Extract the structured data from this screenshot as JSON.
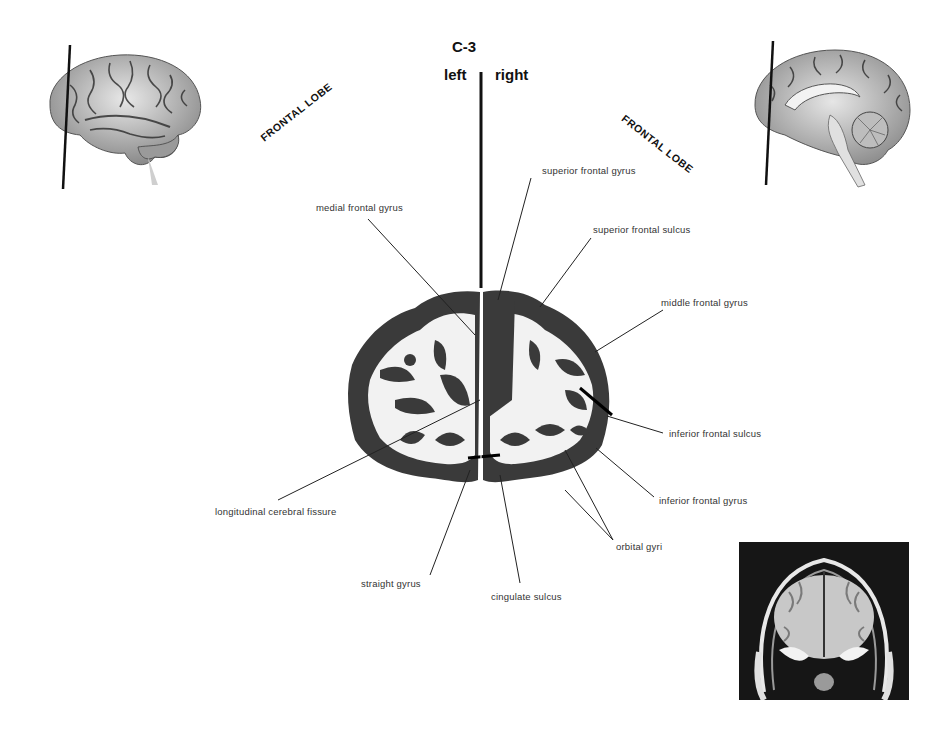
{
  "header": {
    "section": "C-3",
    "left_label": "left",
    "right_label": "right"
  },
  "lobes": {
    "left": "FRONTAL LOBE",
    "right": "FRONTAL LOBE"
  },
  "thumbnails": {
    "lateral_view": "lateral-brain-view",
    "medial_view": "medial-brain-view",
    "mri": "coronal-mri"
  },
  "labels": {
    "superior_frontal_gyrus": "superior frontal gyrus",
    "medial_frontal_gyrus": "medial frontal gyrus",
    "superior_frontal_sulcus": "superior frontal sulcus",
    "middle_frontal_gyrus": "middle frontal gyrus",
    "inferior_frontal_sulcus": "inferior frontal sulcus",
    "inferior_frontal_gyrus": "inferior frontal gyrus",
    "longitudinal_cerebral_fissure": "longitudinal cerebral fissure",
    "orbital_gyri": "orbital gyri",
    "straight_gyrus": "straight gyrus",
    "cingulate_sulcus": "cingulate sulcus"
  }
}
